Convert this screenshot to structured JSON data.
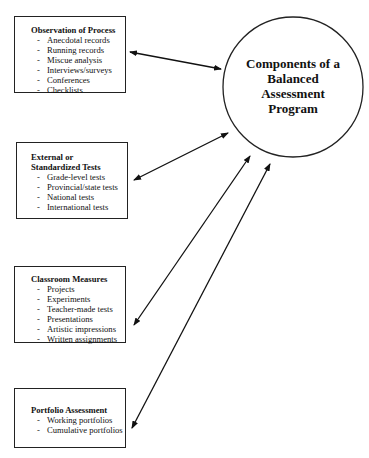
{
  "center": {
    "label_lines": [
      "Components of a",
      "Balanced",
      "Assessment",
      "Program"
    ]
  },
  "boxes": [
    {
      "title_lines": [
        "Observation of Process"
      ],
      "items": [
        "Anecdotal records",
        "Running records",
        "Miscue analysis",
        "Interviews/surveys",
        "Conferences",
        "Checklists"
      ]
    },
    {
      "title_lines": [
        "External or",
        "Standardized Tests"
      ],
      "items": [
        "Grade-level tests",
        "Provincial/state tests",
        "National tests",
        "International tests"
      ]
    },
    {
      "title_lines": [
        "Classroom Measures"
      ],
      "items": [
        "Projects",
        "Experiments",
        "Teacher-made tests",
        "Presentations",
        "Artistic impressions",
        "Written assignments"
      ]
    },
    {
      "title_lines": [
        "Portfolio Assessment"
      ],
      "items": [
        "Working portfolios",
        "Cumulative portfolios"
      ]
    }
  ],
  "connectors": [
    {
      "from": "boxes.0",
      "to": "center",
      "type": "double-arrow"
    },
    {
      "from": "boxes.1",
      "to": "center",
      "type": "double-arrow"
    },
    {
      "from": "boxes.2",
      "to": "center",
      "type": "double-arrow"
    },
    {
      "from": "boxes.3",
      "to": "center",
      "type": "double-arrow"
    }
  ],
  "colors": {
    "stroke": "#222222",
    "background": "#ffffff",
    "text": "#111111"
  }
}
